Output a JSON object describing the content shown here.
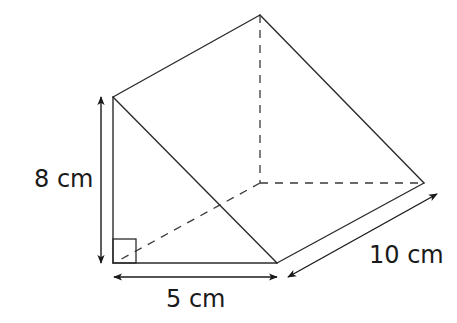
{
  "diagram": {
    "type": "triangular-prism",
    "vertices": {
      "front_top": [
        113,
        97
      ],
      "front_bottom_left": [
        113,
        263
      ],
      "front_bottom_right": [
        277,
        263
      ],
      "back_top": [
        260,
        15
      ],
      "back_bottom_left": [
        260,
        183
      ],
      "back_bottom_right": [
        424,
        183
      ]
    },
    "colors": {
      "line": "#2b2b2b",
      "background": "#ffffff",
      "text": "#1a1a1a"
    },
    "labels": {
      "height": "8 cm",
      "base": "5 cm",
      "length": "10 cm"
    },
    "right_angle_marker": true
  }
}
